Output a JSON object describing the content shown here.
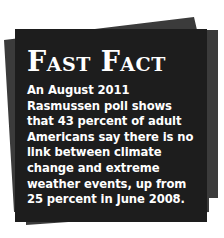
{
  "fast_fact": {
    "title": "Fast Fact",
    "text": "An August 2011 Rasmussen poll shows that 43 percent of adult Americans say there is no link between climate change and extreme weather events, up from 25 percent in June 2008."
  },
  "colors": {
    "card_front": "#1d1d1d",
    "card_back": "#3b3b3b",
    "text": "#ffffff",
    "background": "#ffffff"
  }
}
